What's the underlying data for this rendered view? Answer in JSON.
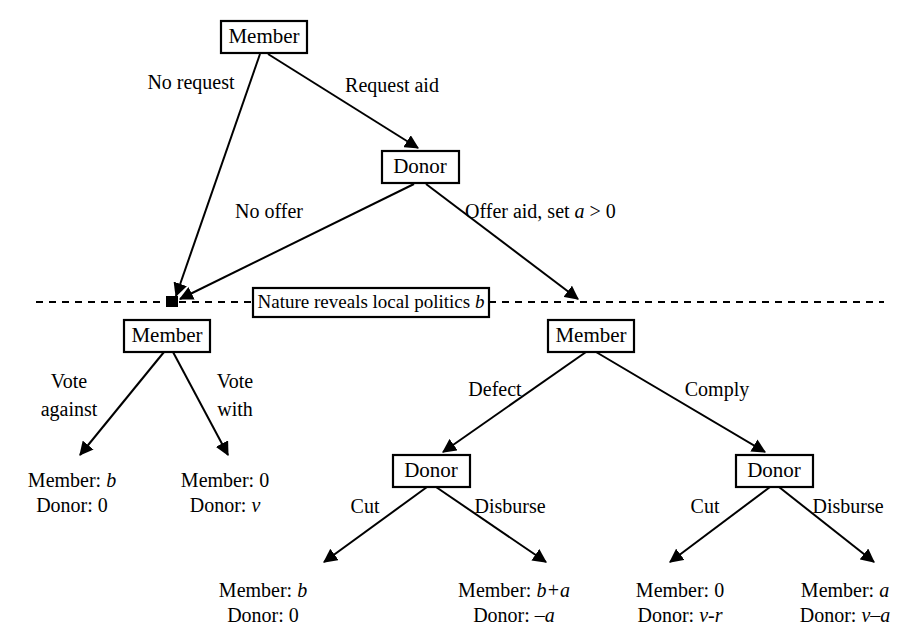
{
  "figure": {
    "type": "extensive-form-game-tree",
    "nodes": [
      {
        "id": "root-member",
        "label": "Member",
        "player": "Member",
        "x": 264,
        "y": 37
      },
      {
        "id": "donor-top",
        "label": "Donor",
        "player": "Donor",
        "x": 420,
        "y": 167
      },
      {
        "id": "member-left",
        "label": "Member",
        "player": "Member",
        "x": 168,
        "y": 335
      },
      {
        "id": "member-right",
        "label": "Member",
        "player": "Member",
        "x": 591,
        "y": 336
      },
      {
        "id": "donor-defect",
        "label": "Donor",
        "player": "Donor",
        "x": 431,
        "y": 470
      },
      {
        "id": "donor-comply",
        "label": "Donor",
        "player": "Donor",
        "x": 774,
        "y": 470
      }
    ],
    "information_set": {
      "label": "Nature reveals local politics b",
      "label_plain": "Nature reveals local politics ",
      "label_italic": "b",
      "style": "dashed",
      "left_point_x": 172,
      "right_point_x": 580,
      "y": 302
    },
    "edges": [
      {
        "from": "root-member",
        "to": "member-left",
        "label": "No request"
      },
      {
        "from": "root-member",
        "to": "donor-top",
        "label": "Request aid"
      },
      {
        "from": "donor-top",
        "to": "member-left",
        "label": "No offer"
      },
      {
        "from": "donor-top",
        "to": "member-right",
        "label": "Offer aid, set a > 0",
        "label_plain": "Offer aid, set ",
        "label_italic": "a",
        "label_tail": " > 0"
      },
      {
        "from": "member-left",
        "to": "payoff-1",
        "label": "Vote against",
        "label_line1": "Vote",
        "label_line2": "against"
      },
      {
        "from": "member-left",
        "to": "payoff-2",
        "label": "Vote with",
        "label_line1": "Vote",
        "label_line2": "with"
      },
      {
        "from": "member-right",
        "to": "donor-defect",
        "label": "Defect"
      },
      {
        "from": "member-right",
        "to": "donor-comply",
        "label": "Comply"
      },
      {
        "from": "donor-defect",
        "to": "payoff-3",
        "label": "Cut"
      },
      {
        "from": "donor-defect",
        "to": "payoff-4",
        "label": "Disburse"
      },
      {
        "from": "donor-comply",
        "to": "payoff-5",
        "label": "Cut"
      },
      {
        "from": "donor-comply",
        "to": "payoff-6",
        "label": "Disburse"
      }
    ],
    "payoffs": [
      {
        "id": "payoff-1",
        "member_label": "Member:",
        "member_value": "b",
        "donor_label": "Donor:",
        "donor_value": "0",
        "x": 72,
        "y": 483
      },
      {
        "id": "payoff-2",
        "member_label": "Member:",
        "member_value": "0",
        "donor_label": "Donor:",
        "donor_value": "v",
        "x": 225,
        "y": 483
      },
      {
        "id": "payoff-3",
        "member_label": "Member:",
        "member_value": "b",
        "donor_label": "Donor:",
        "donor_value": "0",
        "x": 263,
        "y": 592
      },
      {
        "id": "payoff-4",
        "member_label": "Member:",
        "member_value": "b+a",
        "donor_label": "Donor:",
        "donor_value": "–a",
        "x": 514,
        "y": 592
      },
      {
        "id": "payoff-5",
        "member_label": "Member:",
        "member_value": "0",
        "donor_label": "Donor:",
        "donor_value": "v-r",
        "x": 680,
        "y": 592
      },
      {
        "id": "payoff-6",
        "member_label": "Member:",
        "member_value": "a",
        "donor_label": "Donor:",
        "donor_value": "v–a",
        "x": 845,
        "y": 592
      }
    ],
    "colors": {
      "background": "#ffffff",
      "stroke": "#000000",
      "text": "#000000"
    }
  }
}
